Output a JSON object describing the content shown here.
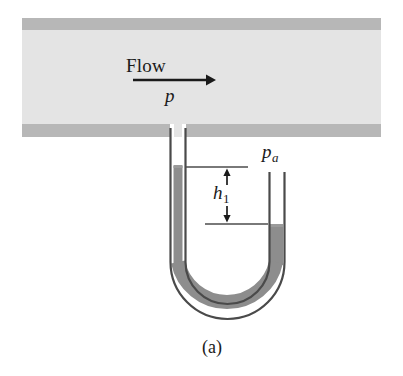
{
  "figure": {
    "caption": "(a)",
    "labels": {
      "flow": "Flow",
      "pressure_pipe": "p",
      "height_symbol": "h",
      "height_subscript": "1",
      "pressure_atmos": "p",
      "pressure_atmos_subscript": "a"
    }
  },
  "colors": {
    "pipe_wall": "#b6b6b6",
    "pipe_interior": "#e2e2e2",
    "mercury": "#8c8c8c",
    "tube_wall": "#4a4a4a",
    "tube_interior": "#ffffff",
    "ink": "#1a1a1a",
    "dimension_line": "#555555",
    "background": "#ffffff"
  },
  "geometry": {
    "pipe": {
      "x": 22,
      "y": 18,
      "width": 359,
      "height": 119,
      "wall_thickness": 12
    },
    "left_tube": {
      "x_outer_left": 170,
      "x_outer_right": 186,
      "bore_left": 174,
      "bore_right": 182
    },
    "right_tube": {
      "x_outer_left": 266,
      "x_outer_right": 286,
      "top_y": 172
    },
    "mercury_level_left_y": 166,
    "mercury_level_right_y": 225,
    "u_bend_bottom_y": 322,
    "dimension_upper_y": 167,
    "dimension_lower_y": 224,
    "arrow_x": 227
  },
  "flow_arrow": {
    "x1": 133,
    "x2": 212,
    "y": 80
  }
}
